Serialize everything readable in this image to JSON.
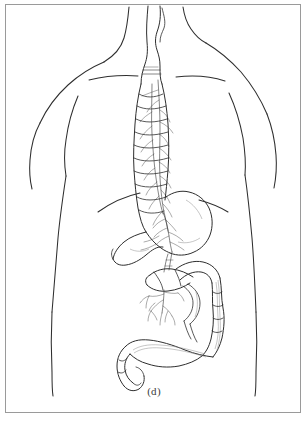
{
  "figure": {
    "caption": "(d)",
    "panel_letter": "d",
    "line_color": "#2e2e2e",
    "background_color": "#ffffff",
    "frame_color": "#9a9a9a",
    "shading_color": "#8d8d8d"
  },
  "anatomy": {
    "body": {
      "label": "human torso posterior outline",
      "parts": [
        {
          "name": "neck",
          "label": "Neck"
        },
        {
          "name": "left-shoulder",
          "label": "Left shoulder"
        },
        {
          "name": "right-shoulder",
          "label": "Right shoulder"
        },
        {
          "name": "left-arm",
          "label": "Left arm"
        },
        {
          "name": "right-arm",
          "label": "Right arm"
        },
        {
          "name": "scapular-line-left",
          "label": "Left scapular contour"
        },
        {
          "name": "scapular-line-right",
          "label": "Right scapular contour"
        },
        {
          "name": "costal-margin",
          "label": "Costal margin"
        },
        {
          "name": "waist-left",
          "label": "Left flank"
        },
        {
          "name": "waist-right",
          "label": "Right flank"
        },
        {
          "name": "hip-left",
          "label": "Left hip"
        },
        {
          "name": "hip-right",
          "label": "Right hip"
        }
      ]
    },
    "organs": [
      {
        "name": "esophagus",
        "label": "Esophagus"
      },
      {
        "name": "vagus-nerve",
        "label": "Vagus nerve"
      },
      {
        "name": "stomach",
        "label": "Stomach"
      },
      {
        "name": "duodenum",
        "label": "Duodenum"
      },
      {
        "name": "small-intestine",
        "label": "Small intestine"
      },
      {
        "name": "ascending-colon",
        "label": "Ascending colon"
      },
      {
        "name": "transverse-colon",
        "label": "Transverse colon"
      },
      {
        "name": "descending-colon",
        "label": "Descending colon"
      },
      {
        "name": "sigmoid-colon",
        "label": "Sigmoid colon"
      },
      {
        "name": "rectum",
        "label": "Rectum"
      },
      {
        "name": "mesenteric-plexus",
        "label": "Mesenteric nerve plexus"
      },
      {
        "name": "celiac-plexus",
        "label": "Celiac plexus"
      }
    ]
  }
}
